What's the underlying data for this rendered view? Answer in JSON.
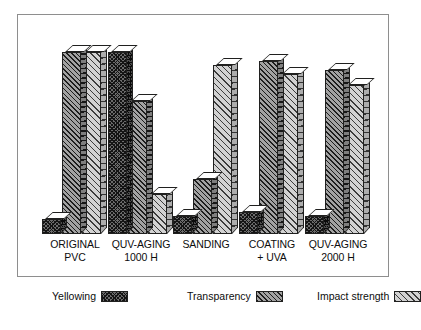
{
  "chart_data": {
    "type": "bar",
    "title": "",
    "subtitle": "",
    "xlabel": "",
    "ylabel": "",
    "grid": false,
    "legend_position": "bottom",
    "style": "3d-grouped-bars",
    "ylim": [
      0,
      100
    ],
    "categories": [
      "ORIGINAL\nPVC",
      "QUV-AGING\n1000 H",
      "SANDING",
      "COATING\n+ UVA",
      "QUV-AGING\n2000 H"
    ],
    "category_lines": [
      [
        "ORIGINAL",
        "PVC"
      ],
      [
        "QUV-AGING",
        "1000 H"
      ],
      [
        "SANDING",
        ""
      ],
      [
        "COATING",
        "+ UVA"
      ],
      [
        "QUV-AGING",
        "2000 H"
      ]
    ],
    "series": [
      {
        "name": "Yellowing",
        "key": "yellowing",
        "values": [
          8,
          100,
          10,
          12,
          10
        ]
      },
      {
        "name": "Transparency",
        "key": "transparency",
        "values": [
          100,
          73,
          30,
          95,
          90
        ]
      },
      {
        "name": "Impact strength",
        "key": "impact_strength",
        "values": [
          100,
          22,
          93,
          88,
          82
        ]
      }
    ]
  },
  "legend": {
    "items": [
      {
        "label": "Yellowing",
        "swatch": "dark-crosshatch-swatch"
      },
      {
        "label": "Transparency",
        "swatch": "medium-hatch-swatch"
      },
      {
        "label": "Impact strength",
        "swatch": "light-hatch-swatch"
      }
    ]
  }
}
